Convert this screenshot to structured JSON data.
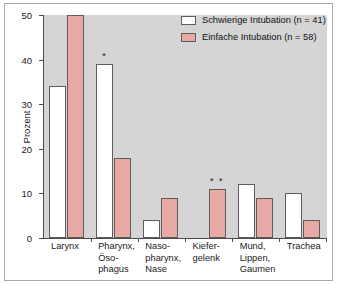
{
  "chart_data": {
    "type": "bar",
    "title": "",
    "xlabel": "",
    "ylabel": "Prozent",
    "ylim": [
      0,
      50
    ],
    "yticks": [
      0,
      10,
      20,
      30,
      40,
      50
    ],
    "grid": false,
    "legend_position": "top-right",
    "categories": [
      "Larynx",
      "Pharynx,\nÖso-\nphagus",
      "Naso-\npharynx,\nNase",
      "Kiefer-\ngelenk",
      "Mund,\nLippen,\nGaumen",
      "Trachea"
    ],
    "series": [
      {
        "name": "Schwierige Intubation (n = 41)",
        "color": "#ffffff",
        "values": [
          34,
          39,
          4,
          0,
          12,
          10
        ]
      },
      {
        "name": "Einfache Intubation (n = 58)",
        "color": "#e8a8a3",
        "values": [
          50,
          18,
          9,
          11,
          9,
          4
        ]
      }
    ],
    "annotations": [
      {
        "text": "*",
        "category": "Pharynx, Öso-phagus",
        "series": "Schwierige Intubation (n = 41)"
      },
      {
        "text": "* *",
        "category": "Kiefer-gelenk",
        "series": "Einfache Intubation (n = 58)"
      }
    ]
  },
  "legend": {
    "items": [
      {
        "label": "Schwierige Intubation (n = 41)",
        "swatch": "white"
      },
      {
        "label": "Einfache Intubation (n = 58)",
        "swatch": "pink"
      }
    ]
  },
  "axis": {
    "y_title": "Prozent",
    "y_labels": [
      "50",
      "40",
      "30",
      "20",
      "10",
      "0"
    ]
  },
  "colors": {
    "plot_background": "#d5d5d5",
    "bar_white": "#ffffff",
    "bar_pink": "#e8a8a3",
    "bar_outline": "#5d5d5d",
    "axis": "#4a4a4a",
    "frame": "#a9a9a9"
  }
}
